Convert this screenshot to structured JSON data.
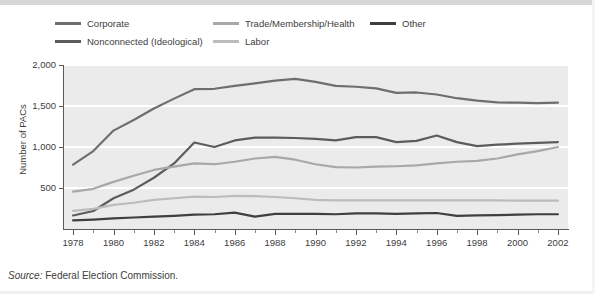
{
  "source": {
    "prefix": "Source:",
    "text": " Federal Election Commission."
  },
  "chart_data": {
    "type": "line",
    "title": "",
    "xlabel": "",
    "ylabel": "Number of PACs",
    "xlim": [
      1977.5,
      2002.5
    ],
    "ylim": [
      0,
      2000
    ],
    "yticks": [
      500,
      1000,
      1500,
      2000
    ],
    "ytick_labels": [
      "500",
      "1,000",
      "1,500",
      "2,000"
    ],
    "xticks": [
      1978,
      1980,
      1982,
      1984,
      1986,
      1988,
      1990,
      1992,
      1994,
      1996,
      1998,
      2000,
      2002
    ],
    "xtick_labels": [
      "1978",
      "1980",
      "1982",
      "1984",
      "1986",
      "1988",
      "1990",
      "1992",
      "1994",
      "1996",
      "1998",
      "2000",
      "2002"
    ],
    "xminor_ticks": [
      1979,
      1981,
      1983,
      1985,
      1987,
      1989,
      1991,
      1993,
      1995,
      1997,
      1999,
      2001
    ],
    "grid": "horizontal-white",
    "legend_position": "top",
    "x": [
      1978,
      1979,
      1980,
      1981,
      1982,
      1983,
      1984,
      1985,
      1986,
      1987,
      1988,
      1989,
      1990,
      1991,
      1992,
      1993,
      1994,
      1995,
      1996,
      1997,
      1998,
      1999,
      2000,
      2001,
      2002
    ],
    "series": [
      {
        "name": "Corporate",
        "color": "#6e6e6e",
        "values": [
          785,
          950,
          1200,
          1330,
          1470,
          1590,
          1705,
          1710,
          1745,
          1775,
          1810,
          1830,
          1795,
          1745,
          1735,
          1715,
          1660,
          1665,
          1640,
          1595,
          1565,
          1545,
          1540,
          1535,
          1540
        ]
      },
      {
        "name": "Nonconnected (Ideological)",
        "color": "#5c5c5c",
        "values": [
          165,
          220,
          375,
          480,
          625,
          800,
          1055,
          1000,
          1080,
          1115,
          1115,
          1110,
          1100,
          1080,
          1120,
          1120,
          1060,
          1075,
          1140,
          1060,
          1010,
          1030,
          1040,
          1050,
          1060
        ]
      },
      {
        "name": "Trade/Membership/Health",
        "color": "#a8a8a8",
        "values": [
          455,
          490,
          575,
          650,
          720,
          760,
          800,
          790,
          820,
          860,
          880,
          845,
          790,
          755,
          750,
          760,
          765,
          775,
          800,
          820,
          830,
          860,
          910,
          950,
          1000
        ]
      },
      {
        "name": "Labor",
        "color": "#bcbcbc",
        "values": [
          220,
          245,
          295,
          320,
          355,
          375,
          395,
          390,
          405,
          400,
          390,
          375,
          355,
          350,
          350,
          350,
          350,
          350,
          350,
          350,
          350,
          350,
          345,
          345,
          345
        ]
      },
      {
        "name": "Other",
        "color": "#3f3f3f",
        "values": [
          105,
          115,
          130,
          140,
          150,
          160,
          175,
          180,
          200,
          150,
          185,
          185,
          185,
          180,
          190,
          190,
          185,
          190,
          195,
          160,
          165,
          170,
          175,
          180,
          180
        ]
      }
    ]
  }
}
